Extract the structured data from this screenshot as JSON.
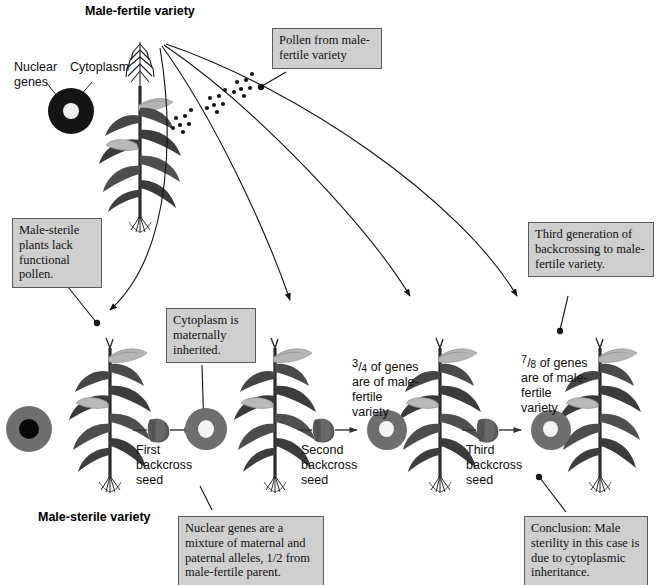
{
  "figure": {
    "type": "diagram",
    "top_title": "Male-fertile variety",
    "bottom_title": "Male-sterile variety"
  },
  "key": {
    "nuclear_genes_label": "Nuclear\ngenes",
    "cytoplasm_label": "Cytoplasm"
  },
  "callouts": {
    "pollen": "Pollen from male-fertile variety",
    "male_sterile": "Male-sterile plants lack functional pollen.",
    "cytoplasm_maternal": "Cytoplasm is maternally inherited.",
    "third_generation": "Third generation of backcrossing to male-fertile variety.",
    "nuclear_mixture": "Nuclear genes are a mixture of maternal and paternal alleles, 1/2 from male-fertile parent.",
    "conclusion": "Conclusion:  Male sterility in this case is due to cytoplasmic inheritance."
  },
  "seeds": [
    {
      "label": "First\nbackcross\nseed"
    },
    {
      "label": "Second\nbackcross\nseed"
    },
    {
      "label": "Third\nbackcross\nseed"
    }
  ],
  "gene_fractions": [
    {
      "numerator": "3",
      "denominator": "4",
      "text": " of genes\nare of male-\nfertile\nvariety"
    },
    {
      "numerator": "7",
      "denominator": "8",
      "text": " of genes\nare of male-\nfertile\nvariety"
    }
  ],
  "colors": {
    "callout_fill": "#cfcfcf",
    "callout_border": "#5a5a5a",
    "cytoplasm_dark": "#1a1a1a",
    "cytoplasm_gray": "#6e6e6e",
    "nucleus_dark": "#000000",
    "nucleus_light": "#f2f2f2",
    "leaf_dark": "#3a3a3a",
    "leaf_mid": "#5c5c5c",
    "ear_light": "#b8b8b8",
    "line": "#111111"
  }
}
